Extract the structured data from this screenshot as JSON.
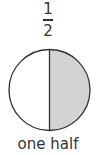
{
  "fraction": {
    "numerator": "1",
    "denominator": "2"
  },
  "diagram": {
    "shape": "circle",
    "parts": 2,
    "shaded_parts": 1,
    "shaded_side": "right",
    "colors": {
      "outline": "#333333",
      "shaded": "#d3d3d3",
      "unshaded": "#ffffff"
    }
  },
  "label": "one half"
}
